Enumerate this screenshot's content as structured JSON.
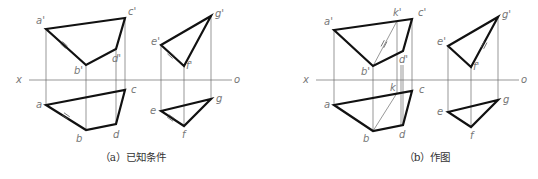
{
  "figures": [
    {
      "id": "a",
      "caption": "（a）已知条件",
      "caption_pos": [
        133,
        161
      ],
      "x_axis": {
        "x1": 29,
        "x2": 232,
        "y": 80,
        "label_x": "x",
        "label_o": "o",
        "x_label_pos": [
          16,
          83
        ],
        "o_label_pos": [
          234,
          83
        ]
      },
      "polygons_thick": [
        {
          "name": "plane-abcd-front",
          "points": [
            [
              46,
              29
            ],
            [
              125,
              18
            ],
            [
              116,
              49
            ],
            [
              86,
              65
            ]
          ]
        },
        {
          "name": "plane-abcd-top",
          "points": [
            [
              46,
              105
            ],
            [
              125,
              90
            ],
            [
              116,
              124
            ],
            [
              86,
              130
            ]
          ]
        },
        {
          "name": "triangle-efg-front",
          "points": [
            [
              161,
              45
            ],
            [
              211,
              16
            ],
            [
              184,
              66
            ]
          ]
        },
        {
          "name": "triangle-efg-top",
          "points": [
            [
              161,
              111
            ],
            [
              211,
              99
            ],
            [
              184,
              126
            ]
          ]
        }
      ],
      "projection_lines": [
        [
          46,
          29,
          46,
          105
        ],
        [
          86,
          65,
          86,
          130
        ],
        [
          116,
          49,
          116,
          124
        ],
        [
          125,
          18,
          125,
          90
        ],
        [
          161,
          45,
          161,
          111
        ],
        [
          184,
          66,
          184,
          126
        ],
        [
          211,
          16,
          211,
          99
        ]
      ],
      "aux_lines": [],
      "ticks": [
        {
          "x": 64,
          "y": 45,
          "angle": 42
        },
        {
          "x": 171,
          "y": 55,
          "angle": 42
        },
        {
          "x": 66,
          "y": 116,
          "angle": 35
        },
        {
          "x": 171,
          "y": 118,
          "angle": 35
        }
      ],
      "labels": [
        {
          "t": "a'",
          "x": 36,
          "y": 24
        },
        {
          "t": "c'",
          "x": 128,
          "y": 15
        },
        {
          "t": "d'",
          "x": 112,
          "y": 62
        },
        {
          "t": "b'",
          "x": 74,
          "y": 74
        },
        {
          "t": "c",
          "x": 131,
          "y": 93
        },
        {
          "t": "a",
          "x": 36,
          "y": 108
        },
        {
          "t": "b",
          "x": 76,
          "y": 142
        },
        {
          "t": "d",
          "x": 113,
          "y": 138
        },
        {
          "t": "e'",
          "x": 151,
          "y": 45
        },
        {
          "t": "g'",
          "x": 215,
          "y": 17
        },
        {
          "t": "f'",
          "x": 186,
          "y": 69
        },
        {
          "t": "g",
          "x": 216,
          "y": 102
        },
        {
          "t": "e",
          "x": 150,
          "y": 114
        },
        {
          "t": "f",
          "x": 182,
          "y": 138
        }
      ]
    },
    {
      "id": "b",
      "caption": "（b）作图",
      "caption_pos": [
        427,
        161
      ],
      "x_axis": {
        "x1": 316,
        "x2": 519,
        "y": 80,
        "label_x": "x",
        "label_o": "o",
        "x_label_pos": [
          303,
          83
        ],
        "o_label_pos": [
          521,
          83
        ]
      },
      "polygons_thick": [
        {
          "name": "plane-abcd-front",
          "points": [
            [
              334,
              30
            ],
            [
              412,
              19
            ],
            [
              403,
              51
            ],
            [
              373,
              66
            ]
          ]
        },
        {
          "name": "plane-abcd-top",
          "points": [
            [
              334,
              105
            ],
            [
              412,
              91
            ],
            [
              403,
              125
            ],
            [
              373,
              131
            ]
          ]
        },
        {
          "name": "triangle-efg-front",
          "points": [
            [
              448,
              46
            ],
            [
              498,
              17
            ],
            [
              471,
              67
            ]
          ]
        },
        {
          "name": "triangle-efg-top",
          "points": [
            [
              448,
              112
            ],
            [
              498,
              100
            ],
            [
              471,
              127
            ]
          ]
        }
      ],
      "projection_lines": [
        [
          334,
          30,
          334,
          105
        ],
        [
          373,
          66,
          373,
          131
        ],
        [
          412,
          19,
          412,
          91
        ],
        [
          448,
          46,
          448,
          112
        ],
        [
          471,
          67,
          471,
          127
        ],
        [
          498,
          17,
          498,
          100
        ],
        [
          397,
          21,
          397,
          93
        ],
        [
          401,
          65,
          401,
          125
        ],
        [
          403,
          65,
          403,
          125
        ]
      ],
      "aux_lines": [
        {
          "name": "line-bk-front",
          "coords": [
            373,
            66,
            397,
            21
          ]
        },
        {
          "name": "line-bk-top",
          "coords": [
            373,
            131,
            397,
            93
          ]
        }
      ],
      "ticks": [
        {
          "x": 384,
          "y": 44,
          "angle": -62
        },
        {
          "x": 484,
          "y": 45,
          "angle": -62
        }
      ],
      "labels": [
        {
          "t": "a'",
          "x": 324,
          "y": 25
        },
        {
          "t": "k'",
          "x": 393,
          "y": 16
        },
        {
          "t": "c'",
          "x": 418,
          "y": 16
        },
        {
          "t": "d'",
          "x": 399,
          "y": 63
        },
        {
          "t": "b'",
          "x": 361,
          "y": 75
        },
        {
          "t": "k",
          "x": 390,
          "y": 91
        },
        {
          "t": "c",
          "x": 419,
          "y": 93
        },
        {
          "t": "a",
          "x": 324,
          "y": 108
        },
        {
          "t": "b",
          "x": 363,
          "y": 142
        },
        {
          "t": "d",
          "x": 399,
          "y": 138
        },
        {
          "t": "e'",
          "x": 437,
          "y": 45
        },
        {
          "t": "g'",
          "x": 502,
          "y": 18
        },
        {
          "t": "f'",
          "x": 473,
          "y": 70
        },
        {
          "t": "g",
          "x": 503,
          "y": 103
        },
        {
          "t": "e",
          "x": 437,
          "y": 115
        },
        {
          "t": "f",
          "x": 470,
          "y": 139
        }
      ]
    }
  ],
  "colors": {
    "thick": "#111111",
    "thin": "#6b6b6b",
    "label": "#777777",
    "caption": "#333333"
  }
}
